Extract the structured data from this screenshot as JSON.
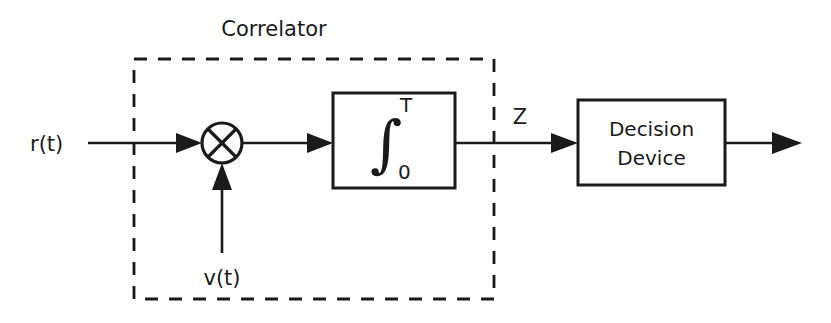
{
  "diagram": {
    "kind": "block-diagram",
    "title_label": "Correlator",
    "background_color": "#ffffff",
    "line_color": "#1a1a1a",
    "input_signal_label": "r(t)",
    "reference_signal_label": "v(t)",
    "output_variable_label": "Z",
    "multiplier": {
      "symbol_name": "circled-multiply",
      "glyph": "⊗"
    },
    "integrator": {
      "glyph": "∫",
      "upper_limit": "T",
      "lower_limit": "0"
    },
    "decision_block": {
      "line1": "Decision",
      "line2": "Device"
    },
    "enclosure": {
      "style": "dashed",
      "label": "Correlator"
    }
  }
}
